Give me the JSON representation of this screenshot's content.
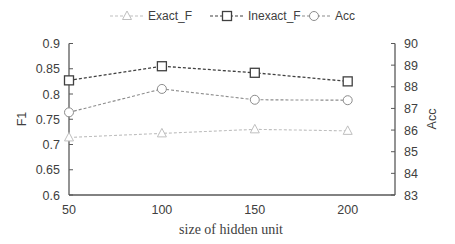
{
  "chart_data": {
    "type": "line",
    "title": "",
    "xlabel": "size of hidden unit",
    "ylabel": "F1",
    "ylabel_right": "Acc",
    "categories": [
      "50",
      "100",
      "150",
      "200"
    ],
    "x": [
      50,
      100,
      150,
      200
    ],
    "ylim": [
      0.6,
      0.9
    ],
    "ylim_right": [
      83,
      90
    ],
    "yticks": [
      "0.9",
      "0.85",
      "0.8",
      "0.75",
      "0.7",
      "0.65",
      "0.6"
    ],
    "yticks_right": [
      "90",
      "89",
      "88",
      "87",
      "86",
      "85",
      "84",
      "83"
    ],
    "grid": false,
    "legend_position": "top",
    "series": [
      {
        "name": "Exact_F",
        "axis": "left",
        "marker": "triangle",
        "color": "#bfbfbf",
        "values": [
          0.714,
          0.722,
          0.73,
          0.727
        ]
      },
      {
        "name": "Inexact_F",
        "axis": "left",
        "marker": "square",
        "color": "#404040",
        "values": [
          0.827,
          0.855,
          0.842,
          0.825
        ]
      },
      {
        "name": "Acc",
        "axis": "right",
        "marker": "circle",
        "color": "#8c8c8c",
        "values": [
          86.82,
          87.9,
          87.4,
          87.38
        ]
      }
    ]
  }
}
